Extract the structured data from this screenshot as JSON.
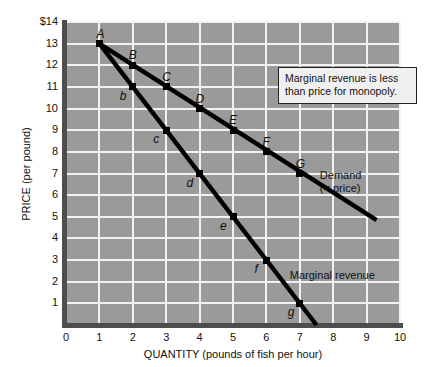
{
  "chart_data": {
    "type": "line",
    "title": "",
    "xlabel": "QUANTITY (pounds of fish per hour)",
    "ylabel": "PRICE (per pound)",
    "xlim": [
      0,
      10
    ],
    "ylim": [
      0,
      14
    ],
    "grid": true,
    "plot_background": "#9a9a9a",
    "gridline_color": "#f2f2f2",
    "line_color": "#000000",
    "xticks": [
      "0",
      "1",
      "2",
      "3",
      "4",
      "5",
      "6",
      "7",
      "8",
      "9",
      "10"
    ],
    "yticks": [
      "1",
      "2",
      "3",
      "4",
      "5",
      "6",
      "7",
      "8",
      "9",
      "10",
      "11",
      "12",
      "13",
      "$14"
    ],
    "ytick_values": [
      1,
      2,
      3,
      4,
      5,
      6,
      7,
      8,
      9,
      10,
      11,
      12,
      13,
      14
    ],
    "xtick_values": [
      0,
      1,
      2,
      3,
      4,
      5,
      6,
      7,
      8,
      9,
      10
    ],
    "series": [
      {
        "name": "Demand (= price)",
        "label_line1": "Demand",
        "label_line2": "(= price)",
        "label_x": 7.6,
        "label_y": 7.2,
        "x": [
          1,
          9.3
        ],
        "y": [
          13,
          4.85
        ],
        "points": [
          {
            "label": "A",
            "x": 1,
            "y": 13,
            "lx": -3,
            "ly": -16
          },
          {
            "label": "B",
            "x": 2,
            "y": 12,
            "lx": -4,
            "ly": -16
          },
          {
            "label": "C",
            "x": 3,
            "y": 11,
            "lx": -4,
            "ly": -16
          },
          {
            "label": "D",
            "x": 4,
            "y": 10,
            "lx": -4,
            "ly": -16
          },
          {
            "label": "E",
            "x": 5,
            "y": 9,
            "lx": -4,
            "ly": -16
          },
          {
            "label": "F",
            "x": 6,
            "y": 8,
            "lx": -4,
            "ly": -16
          },
          {
            "label": "G",
            "x": 7,
            "y": 7,
            "lx": -4,
            "ly": -16
          }
        ]
      },
      {
        "name": "Marginal revenue",
        "label_line1": "Marginal revenue",
        "label_line2": "",
        "label_x": 6.7,
        "label_y": 2.6,
        "x": [
          1,
          7.5
        ],
        "y": [
          13,
          0
        ],
        "points": [
          {
            "label": "b",
            "x": 2,
            "y": 11,
            "lx": -13,
            "ly": 3
          },
          {
            "label": "c",
            "x": 3,
            "y": 9,
            "lx": -13,
            "ly": 3
          },
          {
            "label": "d",
            "x": 4,
            "y": 7,
            "lx": -13,
            "ly": 3
          },
          {
            "label": "e",
            "x": 5,
            "y": 5,
            "lx": -13,
            "ly": 3
          },
          {
            "label": "f",
            "x": 6,
            "y": 3,
            "lx": -12,
            "ly": 3
          },
          {
            "label": "g",
            "x": 7,
            "y": 1,
            "lx": -12,
            "ly": 3
          }
        ]
      }
    ],
    "annotations": [
      {
        "name": "callout",
        "line1": "Marginal revenue is less",
        "line2": "than price for monopoly."
      }
    ]
  }
}
